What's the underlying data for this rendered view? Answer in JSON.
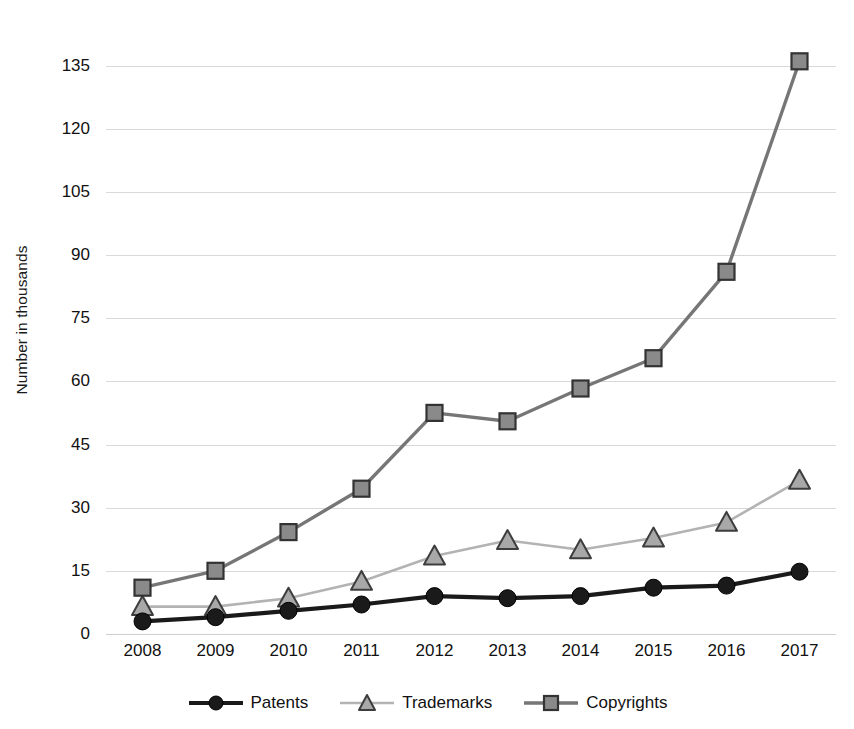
{
  "chart_data": {
    "type": "line",
    "title": "",
    "xlabel": "",
    "ylabel": "Number in thousands",
    "categories": [
      "2008",
      "2009",
      "2010",
      "2011",
      "2012",
      "2013",
      "2014",
      "2015",
      "2016",
      "2017"
    ],
    "x": [
      2008,
      2009,
      2010,
      2011,
      2012,
      2013,
      2014,
      2015,
      2016,
      2017
    ],
    "ylim": [
      0,
      140
    ],
    "yticks": [
      0,
      15,
      30,
      45,
      60,
      75,
      90,
      105,
      120,
      135
    ],
    "ytick_labels": [
      "0",
      "15",
      "30",
      "45",
      "60",
      "75",
      "90",
      "105",
      "120",
      "135"
    ],
    "grid": true,
    "legend_position": "bottom",
    "series": [
      {
        "name": "Patents",
        "marker": "circle",
        "color": "#1a1a1a",
        "line_color": "#1a1a1a",
        "values": [
          3,
          4,
          5.5,
          7,
          9,
          8.5,
          9,
          11,
          11.5,
          14.8
        ]
      },
      {
        "name": "Trademarks",
        "marker": "triangle",
        "color": "#9d9d9d",
        "line_color": "#b3b3b3",
        "values": [
          6.5,
          6.5,
          8.5,
          12.5,
          18.5,
          22.2,
          20,
          22.8,
          26.5,
          36.5
        ]
      },
      {
        "name": "Copyrights",
        "marker": "square",
        "color": "#6e6e6e",
        "line_color": "#767676",
        "values": [
          11,
          15,
          24.2,
          34.5,
          52.5,
          50.5,
          58.3,
          65.5,
          86,
          136
        ]
      }
    ]
  },
  "legend": {
    "items": [
      {
        "label": "Patents",
        "marker": "circle-marker-icon",
        "color": "#1a1a1a"
      },
      {
        "label": "Trademarks",
        "marker": "triangle-marker-icon",
        "color": "#b3b3b3"
      },
      {
        "label": "Copyrights",
        "marker": "square-marker-icon",
        "color": "#767676"
      }
    ]
  },
  "colors": {
    "background": "#ffffff",
    "gridline": "#d9d9d9",
    "text": "#111111",
    "patents": "#1a1a1a",
    "trademarks": "#b3b3b3",
    "copyrights": "#767676"
  }
}
